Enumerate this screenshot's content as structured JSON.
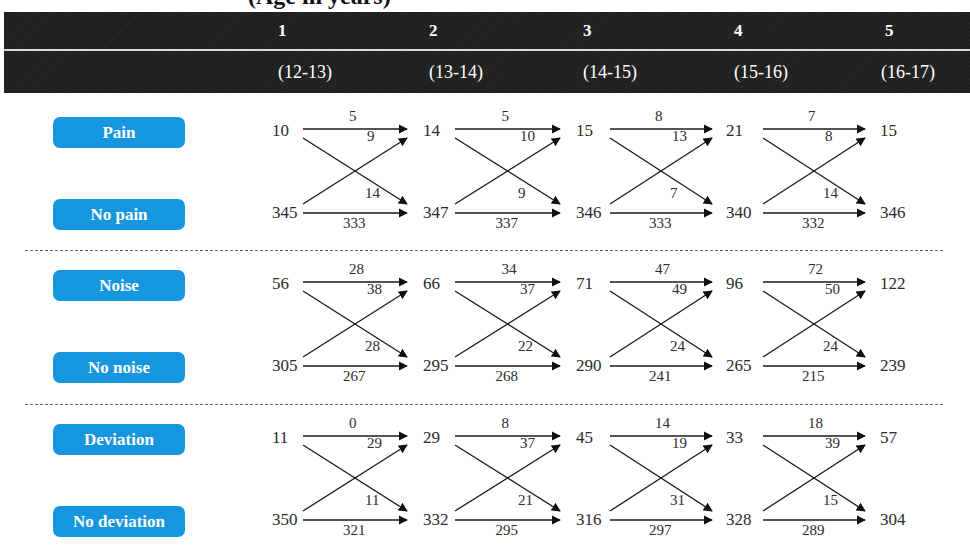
{
  "title": "(Age in years)",
  "header": {
    "waves": [
      {
        "number": "1",
        "ages": "(12-13)"
      },
      {
        "number": "2",
        "ages": "(13-14)"
      },
      {
        "number": "3",
        "ages": "(14-15)"
      },
      {
        "number": "4",
        "ages": "(15-16)"
      },
      {
        "number": "5",
        "ages": "(16-17)"
      }
    ]
  },
  "colors": {
    "header_bg": "#1f1f1f",
    "pill_bg": "#1696de",
    "pill_text": "#ffffff",
    "text": "#2b2b2b"
  },
  "groups": [
    {
      "top_label": "Pain",
      "bottom_label": "No pain",
      "top_counts": [
        "10",
        "14",
        "15",
        "21",
        "15"
      ],
      "bottom_counts": [
        "345",
        "347",
        "346",
        "340",
        "346"
      ],
      "transitions": [
        {
          "stay_top": "5",
          "bottom_to_top": "9",
          "top_to_bottom": "14",
          "stay_bottom": "333"
        },
        {
          "stay_top": "5",
          "bottom_to_top": "10",
          "top_to_bottom": "9",
          "stay_bottom": "337"
        },
        {
          "stay_top": "8",
          "bottom_to_top": "13",
          "top_to_bottom": "7",
          "stay_bottom": "333"
        },
        {
          "stay_top": "7",
          "bottom_to_top": "8",
          "top_to_bottom": "14",
          "stay_bottom": "332"
        }
      ]
    },
    {
      "top_label": "Noise",
      "bottom_label": "No noise",
      "top_counts": [
        "56",
        "66",
        "71",
        "96",
        "122"
      ],
      "bottom_counts": [
        "305",
        "295",
        "290",
        "265",
        "239"
      ],
      "transitions": [
        {
          "stay_top": "28",
          "bottom_to_top": "38",
          "top_to_bottom": "28",
          "stay_bottom": "267"
        },
        {
          "stay_top": "34",
          "bottom_to_top": "37",
          "top_to_bottom": "22",
          "stay_bottom": "268"
        },
        {
          "stay_top": "47",
          "bottom_to_top": "49",
          "top_to_bottom": "24",
          "stay_bottom": "241"
        },
        {
          "stay_top": "72",
          "bottom_to_top": "50",
          "top_to_bottom": "24",
          "stay_bottom": "215"
        }
      ]
    },
    {
      "top_label": "Deviation",
      "bottom_label": "No deviation",
      "top_counts": [
        "11",
        "29",
        "45",
        "33",
        "57"
      ],
      "bottom_counts": [
        "350",
        "332",
        "316",
        "328",
        "304"
      ],
      "transitions": [
        {
          "stay_top": "0",
          "bottom_to_top": "29",
          "top_to_bottom": "11",
          "stay_bottom": "321"
        },
        {
          "stay_top": "8",
          "bottom_to_top": "37",
          "top_to_bottom": "21",
          "stay_bottom": "295"
        },
        {
          "stay_top": "14",
          "bottom_to_top": "19",
          "top_to_bottom": "31",
          "stay_bottom": "297"
        },
        {
          "stay_top": "18",
          "bottom_to_top": "39",
          "top_to_bottom": "15",
          "stay_bottom": "289"
        }
      ]
    }
  ]
}
